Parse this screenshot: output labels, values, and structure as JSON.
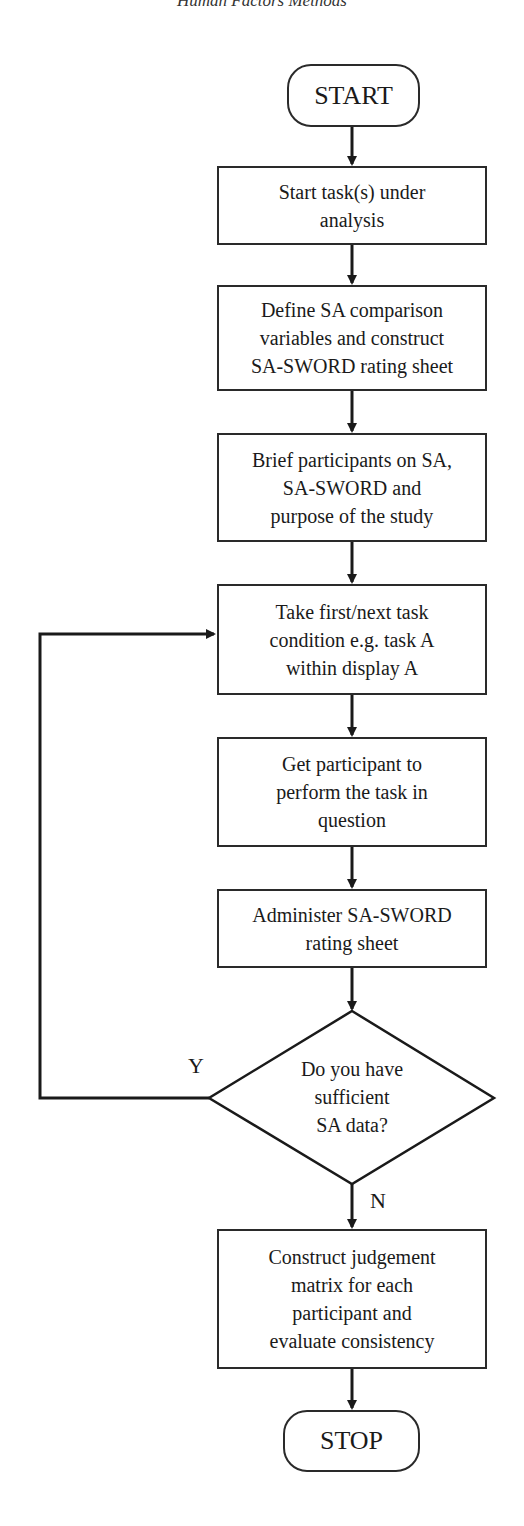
{
  "page": {
    "running_head": "Human Factors Methods"
  },
  "flowchart": {
    "start": {
      "label": "START"
    },
    "steps": [
      {
        "id": "step-1",
        "label": "Start task(s) under\nanalysis"
      },
      {
        "id": "step-2",
        "label": "Define SA comparison\nvariables and construct\nSA-SWORD rating sheet"
      },
      {
        "id": "step-3",
        "label": "Brief participants on SA,\nSA-SWORD and\npurpose of the study"
      },
      {
        "id": "step-4",
        "label": "Take first/next task\ncondition e.g. task A\nwithin display A"
      },
      {
        "id": "step-5",
        "label": "Get participant to\nperform the task in\nquestion"
      },
      {
        "id": "step-6",
        "label": "Administer SA-SWORD\nrating sheet"
      }
    ],
    "decision": {
      "label": "Do you have\nsufficient\nSA data?",
      "yes_label": "Y",
      "no_label": "N"
    },
    "final_step": {
      "label": "Construct judgement\nmatrix for each\nparticipant and\nevaluate consistency"
    },
    "stop": {
      "label": "STOP"
    }
  }
}
